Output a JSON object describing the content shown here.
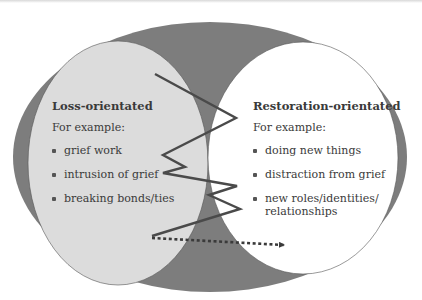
{
  "diagram": {
    "colors": {
      "outer_ellipse": "#7d7d7d",
      "loss_ellipse": "#dcdcdc",
      "restoration_ellipse": "#ffffff",
      "zigzag_line": "#4a4a4a",
      "text": "#3a3a3a"
    },
    "loss": {
      "heading": "Loss-orientated",
      "subheading": "For example:",
      "items": [
        "grief work",
        "intrusion of grief",
        "breaking bonds/ties"
      ]
    },
    "restoration": {
      "heading": "Restoration-orientated",
      "subheading": "For example:",
      "items": [
        "doing new things",
        "distraction from grief",
        "new roles/identities/",
        "relationships"
      ]
    },
    "oscillation": {
      "label": "oscillation zigzag",
      "points": "155,74 236,118 163,155 185,167 163,173 237,186 209,195 240,209 152,236"
    },
    "time_arrow": {
      "label": "dotted time arrow",
      "from": [
        152,
        238
      ],
      "to": [
        286,
        245
      ]
    }
  }
}
